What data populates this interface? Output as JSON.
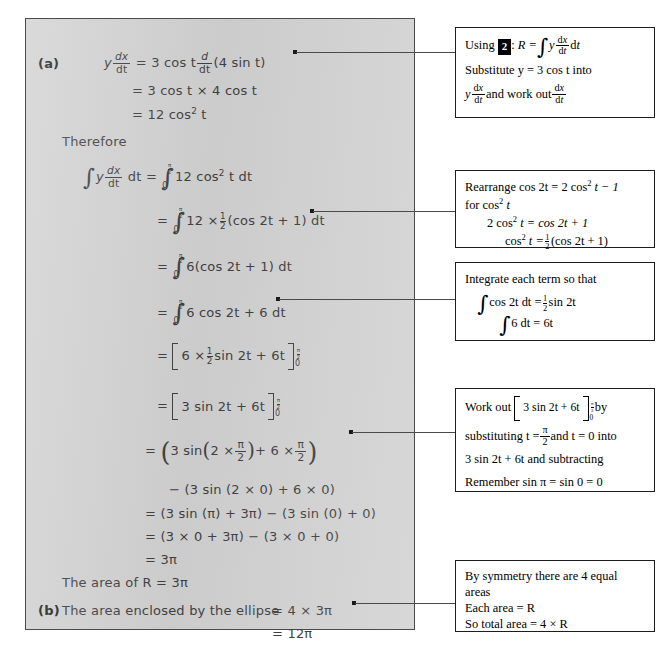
{
  "document": {
    "title": "Worked solution: area enclosed by an ellipse using parametric integration"
  },
  "solution": {
    "part_a_label": "(a)",
    "part_b_label": "(b)",
    "therefore": "Therefore",
    "lines": {
      "a1_lhs": "y",
      "a1_eq": "= 3 cos t",
      "a1_tail": "(4 sin t)",
      "a2": "= 3 cos t × 4 cos t",
      "a3": "= 12 cos",
      "a3_sup": "2",
      "a3_tail": " t",
      "i1_lhs": "y",
      "i1_dt": "dt =",
      "i1_rhs": "12 cos",
      "i1_sup": "2",
      "i1_tail": " t dt",
      "i2_eq": "=",
      "i2_rhs_a": "12 ×",
      "i2_rhs_b": "(cos 2t + 1) dt",
      "i3_eq": "=",
      "i3_rhs": "6(cos 2t + 1) dt",
      "i4_eq": "=",
      "i4_rhs": "6 cos 2t + 6 dt",
      "b1_eq": "=",
      "b1_inner_a": "6 ×",
      "b1_inner_b": "sin 2t + 6t",
      "b2_eq": "=",
      "b2_inner": "3 sin 2t + 6t",
      "s1_eq": "=",
      "s1_a": "3 sin",
      "s1_b": "2 ×",
      "s1_c": "+ 6 ×",
      "s2": "− (3 sin (2 × 0) + 6 × 0)",
      "s3": "= (3 sin (π) + 3π) − (3 sin (0) + 0)",
      "s4": "= (3 × 0 + 3π) − (3 × 0 + 0)",
      "s5": "= 3π",
      "area_r": "The area of R = 3π",
      "b_text": "The area enclosed by the ellipse",
      "b_eq1": "= 4 × 3π",
      "b_eq2": "= 12π",
      "limit_upper_num": "π",
      "limit_upper_den": "2",
      "limit_lower": "0",
      "dx": "dx",
      "dt": "dt",
      "d": "d",
      "half_num": "1",
      "half_den": "2",
      "pi": "π",
      "two": "2"
    }
  },
  "callouts": [
    {
      "id": "callout-using-2",
      "rows": [
        "Using",
        "R =",
        "y",
        "dt",
        "Substitute y = 3 cos t into",
        "y",
        "and work out"
      ],
      "badge": "2"
    },
    {
      "id": "callout-rearrange",
      "rows": [
        "Rearrange cos 2t = 2 cos",
        "t − 1",
        "for cos",
        "t",
        "2 cos",
        "t = cos 2t + 1",
        "cos",
        "t =",
        "(cos 2t + 1)"
      ]
    },
    {
      "id": "callout-integrate",
      "rows": [
        "Integrate each term so that",
        "cos 2t dt =",
        "sin 2t",
        "6 dt = 6t"
      ]
    },
    {
      "id": "callout-work-out",
      "rows": [
        "Work out",
        "3 sin 2t + 6t",
        "by",
        "substituting t =",
        "and t = 0 into",
        "3 sin 2t + 6t and subtracting",
        "Remember sin π = sin 0 = 0"
      ]
    },
    {
      "id": "callout-symmetry",
      "rows": [
        "By symmetry there are 4 equal",
        "areas",
        "Each area = R",
        "So total area = 4 × R"
      ]
    }
  ],
  "colors": {
    "panel_background": "#d2d2d2",
    "panel_border": "#4a4a4a",
    "ink": "#3f3f3f",
    "callout_border": "#1d1d1d",
    "callout_background": "#ffffff",
    "badge_background": "#000000"
  }
}
